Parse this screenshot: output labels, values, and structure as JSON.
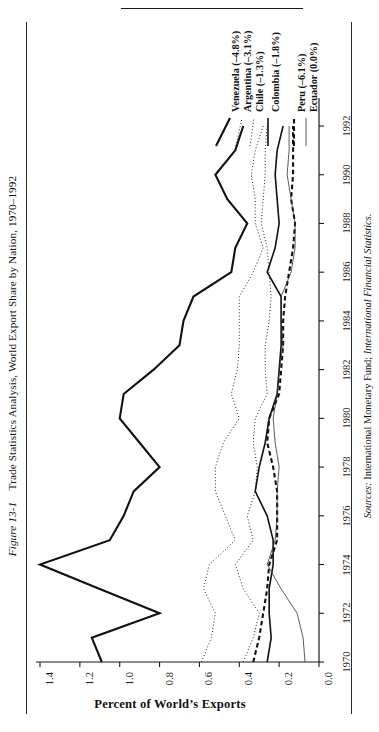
{
  "figure": {
    "number": "Figure 13-1",
    "caption": "Trade Statistics Analysis, World Export Share by Nation, 1970–1992"
  },
  "source": {
    "label": "Sources:",
    "text": " International Monetary Fund; ",
    "publication": "International Financial Statistics."
  },
  "axis_title": "Percent of World’s Exports",
  "chart_data": {
    "type": "line",
    "title": "Trade Statistics Analysis, World Export Share by Nation, 1970–1992",
    "orientation": "rotated-90",
    "xlabel": "",
    "ylabel": "Percent of World’s Exports",
    "ylim": [
      0.0,
      1.4
    ],
    "yticks": [
      "0.0",
      "0.2",
      "0.4",
      "0.6",
      "0.8",
      "1.0",
      "1.2",
      "1.4"
    ],
    "grid": false,
    "legend_position": "top",
    "x": [
      1970,
      1971,
      1972,
      1973,
      1974,
      1975,
      1976,
      1977,
      1978,
      1979,
      1980,
      1981,
      1982,
      1983,
      1984,
      1985,
      1986,
      1987,
      1988,
      1989,
      1990,
      1991,
      1992
    ],
    "xticks": [
      "1970",
      "1972",
      "1974",
      "1976",
      "1978",
      "1980",
      "1982",
      "1984",
      "1986",
      "1988",
      "1990",
      "1992"
    ],
    "series": [
      {
        "name": "Venezuela",
        "label": "Venezuela (–4.8%)",
        "style": "solid-thick",
        "width": 2.1,
        "dash": "",
        "color": "#111111",
        "values": [
          1.09,
          1.14,
          0.8,
          1.1,
          1.4,
          1.05,
          0.98,
          0.93,
          0.8,
          0.9,
          1.0,
          0.98,
          0.83,
          0.7,
          0.68,
          0.63,
          0.44,
          0.42,
          0.36,
          0.46,
          0.52,
          0.42,
          0.38
        ]
      },
      {
        "name": "Argentina",
        "label": "Argentina (–3.1%)",
        "style": "dotted",
        "width": 1.0,
        "dash": "1,2.2",
        "color": "#222222",
        "values": [
          0.59,
          0.54,
          0.52,
          0.58,
          0.55,
          0.42,
          0.47,
          0.52,
          0.52,
          0.48,
          0.4,
          0.44,
          0.41,
          0.4,
          0.4,
          0.4,
          0.33,
          0.28,
          0.32,
          0.32,
          0.34,
          0.32,
          0.28
        ]
      },
      {
        "name": "Chile",
        "label": "Chile (–1.3%)",
        "style": "dotted",
        "width": 1.0,
        "dash": "1,2.2",
        "color": "#222222",
        "values": [
          0.38,
          0.33,
          0.3,
          0.38,
          0.42,
          0.33,
          0.36,
          0.32,
          0.31,
          0.33,
          0.32,
          0.26,
          0.27,
          0.27,
          0.25,
          0.24,
          0.25,
          0.26,
          0.29,
          0.28,
          0.27,
          0.27,
          0.26
        ]
      },
      {
        "name": "Colombia",
        "label": "Colombia (–1.8%)",
        "style": "solid",
        "width": 1.6,
        "dash": "",
        "color": "#111111",
        "values": [
          0.26,
          0.24,
          0.25,
          0.25,
          0.23,
          0.23,
          0.26,
          0.32,
          0.3,
          0.27,
          0.25,
          0.21,
          0.2,
          0.19,
          0.19,
          0.19,
          0.26,
          0.22,
          0.2,
          0.21,
          0.22,
          0.21,
          0.18
        ]
      },
      {
        "name": "Peru",
        "label": "Peru (–6.1%)",
        "style": "dashed-thick",
        "width": 2.1,
        "dash": "4.5,3",
        "color": "#111111",
        "values": [
          0.33,
          0.3,
          0.28,
          0.26,
          0.25,
          0.21,
          0.21,
          0.21,
          0.23,
          0.26,
          0.25,
          0.2,
          0.19,
          0.18,
          0.18,
          0.17,
          0.15,
          0.13,
          0.12,
          0.14,
          0.13,
          0.13,
          0.13
        ]
      },
      {
        "name": "Ecuador",
        "label": "Ecuador (0.0%)",
        "style": "solid-thin",
        "width": 0.8,
        "dash": "",
        "color": "#333333",
        "values": [
          0.07,
          0.08,
          0.11,
          0.19,
          0.26,
          0.22,
          0.21,
          0.21,
          0.2,
          0.22,
          0.23,
          0.21,
          0.2,
          0.18,
          0.19,
          0.19,
          0.14,
          0.12,
          0.12,
          0.14,
          0.16,
          0.15,
          0.15
        ]
      }
    ]
  }
}
